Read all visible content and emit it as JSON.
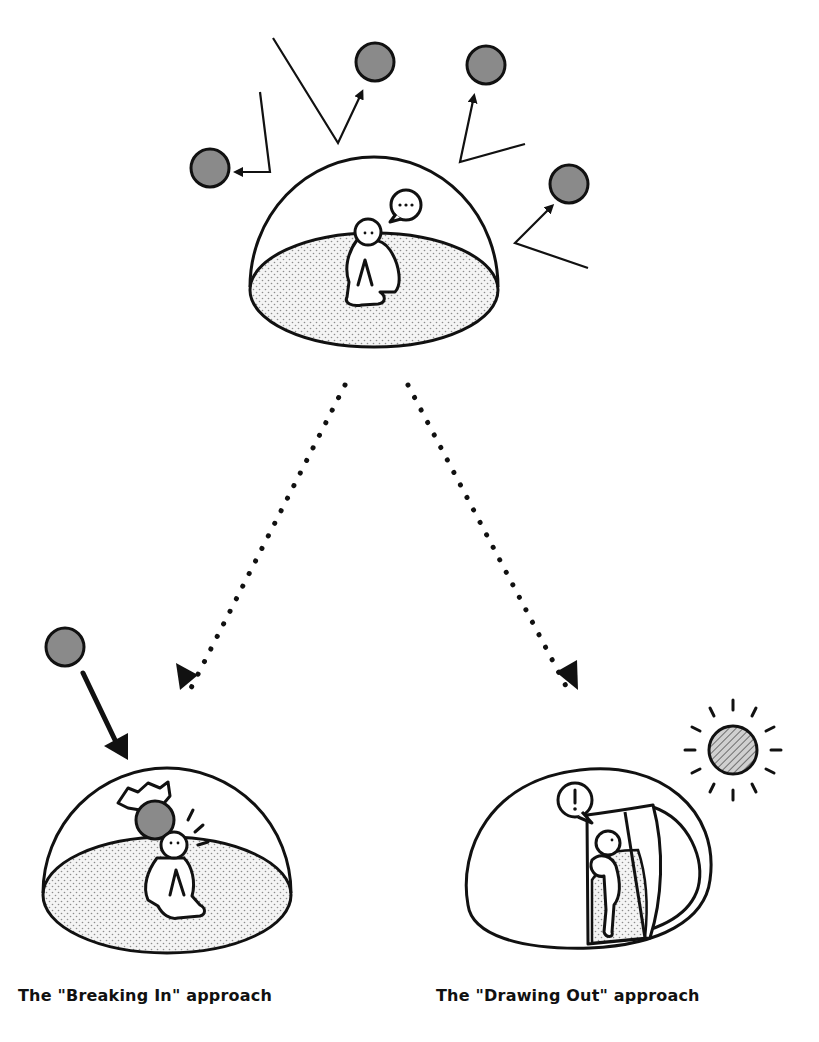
{
  "diagram": {
    "colors": {
      "stroke": "#111111",
      "ball_fill": "#8a8a8a",
      "floor_fill": "#f2f2f2",
      "floor_dots": "#9a9a9a",
      "sun_fill": "#bdbdbd",
      "background": "#ffffff"
    },
    "top_scene": {
      "description": "Person sitting alone inside a protective dome; balls thrown at the dome bounce off",
      "speech_bubble": "...",
      "bouncing_balls": 5
    },
    "left_scene": {
      "caption": "The \"Breaking In\" approach",
      "description": "A ball crashes through the dome top, startling the person"
    },
    "right_scene": {
      "caption": "The \"Drawing Out\" approach",
      "description": "A door opens in the dome toward a sun; the person peeks out",
      "speech_bubble": "!"
    }
  }
}
